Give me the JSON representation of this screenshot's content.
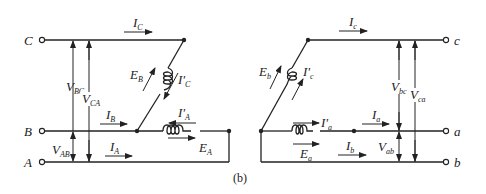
{
  "figure": {
    "caption": "(b)",
    "left_circuit": {
      "terminals": [
        "C",
        "B",
        "A"
      ],
      "currents": {
        "line_c": {
          "sym": "I",
          "sub": "C"
        },
        "line_b": {
          "sym": "I",
          "sub": "B"
        },
        "line_a": {
          "sym": "I",
          "sub": "A"
        },
        "winding_c": {
          "sym": "I'",
          "sub": "C"
        },
        "winding_a": {
          "sym": "I'",
          "sub": "A"
        }
      },
      "emfs": {
        "winding_b": {
          "sym": "E",
          "sub": "B"
        },
        "winding_a": {
          "sym": "E",
          "sub": "A"
        }
      },
      "voltages": {
        "bc": {
          "sym": "V",
          "sub": "BC"
        },
        "ca": {
          "sym": "V",
          "sub": "CA"
        },
        "ab": {
          "sym": "V",
          "sub": "AB"
        }
      }
    },
    "right_circuit": {
      "terminals": [
        "c",
        "a",
        "b"
      ],
      "currents": {
        "line_c": {
          "sym": "I",
          "sub": "c"
        },
        "line_a": {
          "sym": "I",
          "sub": "a"
        },
        "line_b": {
          "sym": "I",
          "sub": "b"
        },
        "winding_c": {
          "sym": "I'",
          "sub": "c"
        },
        "winding_a": {
          "sym": "I'",
          "sub": "a"
        }
      },
      "emfs": {
        "winding_b": {
          "sym": "E",
          "sub": "b"
        },
        "winding_a": {
          "sym": "E",
          "sub": "a"
        }
      },
      "voltages": {
        "bc": {
          "sym": "V",
          "sub": "bc"
        },
        "ca": {
          "sym": "V",
          "sub": "ca"
        },
        "ab": {
          "sym": "V",
          "sub": "ab"
        }
      }
    }
  }
}
